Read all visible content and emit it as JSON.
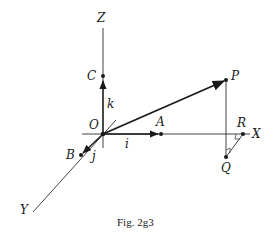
{
  "figure": {
    "caption": "Fig. 2g3",
    "axes": {
      "x_label": "X",
      "y_label": "Y",
      "z_label": "Z"
    },
    "unit_vectors": {
      "i": "i",
      "j": "j",
      "k": "k"
    },
    "points": {
      "origin": "O",
      "a": "A",
      "b": "B",
      "c": "C",
      "p": "P",
      "q": "Q",
      "r": "R"
    },
    "colors": {
      "line": "#1a1a1a",
      "axis": "#444444",
      "background": "#ffffff"
    }
  }
}
